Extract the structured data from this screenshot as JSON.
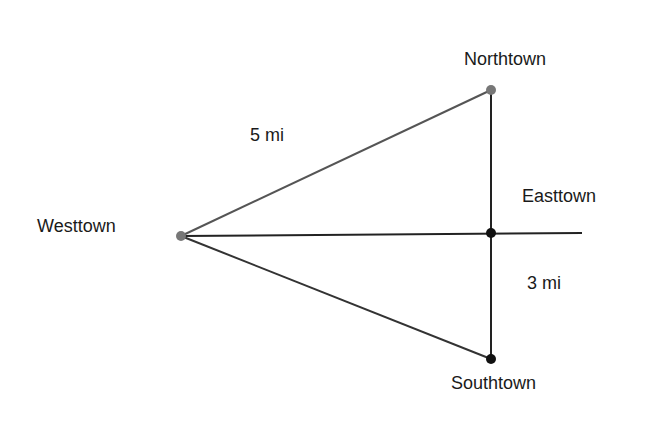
{
  "diagram": {
    "nodes": [
      {
        "id": "westtown",
        "label": "Westtown",
        "x": 181,
        "y": 236,
        "color": "#777777"
      },
      {
        "id": "northtown",
        "label": "Northtown",
        "x": 491,
        "y": 90,
        "color": "#777777"
      },
      {
        "id": "easttown",
        "label": "Easttown",
        "x": 491,
        "y": 233,
        "color": "#111111"
      },
      {
        "id": "southtown",
        "label": "Southtown",
        "x": 491,
        "y": 359,
        "color": "#111111"
      }
    ],
    "edges": [
      {
        "from": "westtown",
        "to": "northtown",
        "label": "5 mi"
      },
      {
        "from": "westtown",
        "to": "southtown",
        "label": ""
      },
      {
        "from": "northtown",
        "to": "southtown",
        "label": "3 mi"
      },
      {
        "from": "westtown",
        "to": "east-end",
        "label": ""
      }
    ],
    "labels": {
      "westtown": "Westtown",
      "northtown": "Northtown",
      "easttown": "Easttown",
      "southtown": "Southtown",
      "dist_west_north": "5 mi",
      "dist_east_south": "3 mi"
    }
  }
}
